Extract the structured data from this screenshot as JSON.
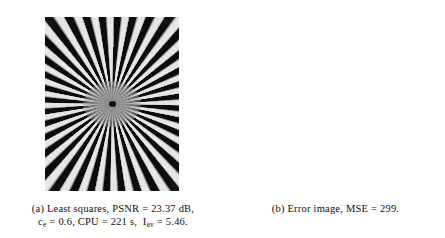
{
  "figure": {
    "panels": [
      {
        "id": "a",
        "label": "(a)",
        "image_name": "least-squares-siemens-star-reconstruction",
        "caption_line1": "(a) Least squares, PSNR = 23.37 dB,",
        "caption_parts": {
          "tag": "(a)",
          "method": "Least squares",
          "psnr_label": "PSNR",
          "psnr_value": "23.37 dB",
          "ce_symbol": "c",
          "ce_subscript": "e",
          "ce_value": "0.6",
          "cpu_label": "CPU",
          "cpu_value": "221 s",
          "iav_symbol": "I",
          "iav_subscript": "av",
          "iav_value": "5.46"
        }
      },
      {
        "id": "b",
        "label": "(b)",
        "image_name": "error-image",
        "caption_line1": "(b) Error image, MSE = 299.",
        "caption_parts": {
          "tag": "(b)",
          "title": "Error image",
          "mse_label": "MSE",
          "mse_value": "299"
        }
      }
    ]
  },
  "chart_data": {
    "type": "image-pair",
    "panels": [
      {
        "panel": "a",
        "content": "Siemens star (radial spoke) test pattern, black and white alternating wedges radiating from a blurred gray center with a small dark dot",
        "spoke_count": 36,
        "background_gray": "#e8e8e6",
        "spoke_dark": "#0a0a0a",
        "metrics": [
          {
            "name": "PSNR",
            "value": 23.37,
            "unit": "dB"
          },
          {
            "name": "c_e",
            "value": 0.6,
            "unit": ""
          },
          {
            "name": "CPU",
            "value": 221,
            "unit": "s"
          },
          {
            "name": "I_av",
            "value": 5.46,
            "unit": ""
          }
        ]
      },
      {
        "panel": "b",
        "content": "Error image: faint dashed gray radial streaks on white background, brightest (near-zero error) at the center, with two strong horizontal streaks through the midline",
        "background": "#ffffff",
        "streak_gray": "#78787a",
        "metrics": [
          {
            "name": "MSE",
            "value": 299,
            "unit": ""
          }
        ]
      }
    ]
  }
}
